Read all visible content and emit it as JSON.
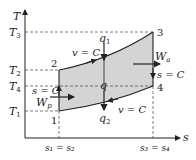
{
  "diagram": {
    "type": "T-s diagram (Brayton cycle)",
    "axes": {
      "y_label": "T",
      "x_label": "s",
      "y_ticks": [
        {
          "label": "T",
          "sub": "3",
          "y": 32
        },
        {
          "label": "T",
          "sub": "2",
          "y": 70
        },
        {
          "label": "T",
          "sub": "4",
          "y": 86
        },
        {
          "label": "T",
          "sub": "1",
          "y": 111
        }
      ],
      "x_ticks": [
        {
          "label": "s₁ = s₂",
          "x": 59
        },
        {
          "label": "s₃ = s₄",
          "x": 153
        }
      ]
    },
    "points": [
      {
        "id": "1",
        "x": 59,
        "y": 111
      },
      {
        "id": "2",
        "x": 59,
        "y": 70
      },
      {
        "id": "3",
        "x": 153,
        "y": 32
      },
      {
        "id": "4",
        "x": 153,
        "y": 86
      }
    ],
    "processes": {
      "top": "v = C",
      "bottom": "v = C",
      "left": "s = C",
      "right": "s = C"
    },
    "quantities": {
      "heat_in": "q",
      "heat_in_sub": "1",
      "heat_out": "q",
      "heat_out_sub": "2",
      "net": "q",
      "work_turbine": "W",
      "work_turbine_sub": "a",
      "work_pump": "W",
      "work_pump_sub": "p"
    },
    "colors": {
      "fill": "#d4d4d4",
      "line": "#222222",
      "dash": "#444444"
    }
  }
}
